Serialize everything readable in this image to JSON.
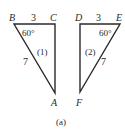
{
  "figure": {
    "caption": "(a)",
    "triangle1": {
      "id_label": "(1)",
      "vertices": {
        "B": "B",
        "C": "C",
        "A": "A"
      },
      "side_BC": "3",
      "side_BA": "7",
      "angle_B": "60°"
    },
    "triangle2": {
      "id_label": "(2)",
      "vertices": {
        "D": "D",
        "E": "E",
        "F": "F"
      },
      "side_DE": "3",
      "side_EF": "7",
      "angle_E": "60°"
    },
    "colors": {
      "line": "#2a2a2a",
      "background": "#ffffff"
    }
  }
}
